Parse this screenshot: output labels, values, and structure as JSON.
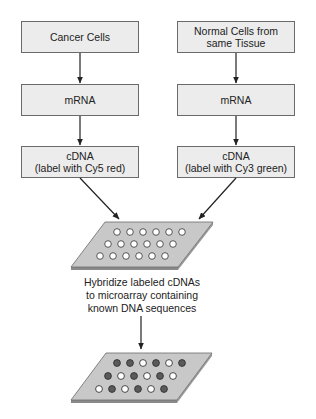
{
  "diagram": {
    "colors": {
      "box_fill": "#ececec",
      "box_border": "#6a6a6a",
      "arrow": "#222222",
      "slide_top": "#c8c8c8",
      "slide_edge": "#8a8a8a",
      "dot_light": "#ffffff",
      "dot_dark": "#5a5a5a"
    },
    "left_column": {
      "source": {
        "lines": [
          "Cancer Cells"
        ]
      },
      "mrna": {
        "lines": [
          "mRNA"
        ]
      },
      "cdna": {
        "lines": [
          "cDNA",
          "(label with Cy5 red)"
        ]
      }
    },
    "right_column": {
      "source": {
        "lines": [
          "Normal Cells from",
          "same Tissue"
        ]
      },
      "mrna": {
        "lines": [
          "mRNA"
        ]
      },
      "cdna": {
        "lines": [
          "cDNA",
          "(label with Cy3 green)"
        ]
      }
    },
    "microarray_before": {
      "label": "Unhybridized microarray",
      "rows": [
        [
          "empty",
          "empty",
          "empty",
          "empty",
          "empty",
          "empty"
        ],
        [
          "empty",
          "empty",
          "empty",
          "empty",
          "empty",
          "empty"
        ],
        [
          "empty",
          "empty",
          "empty",
          "empty",
          "empty",
          "empty"
        ]
      ]
    },
    "hybridize_caption": {
      "lines": [
        "Hybridize labeled cDNAs",
        "to microarray containing",
        "known DNA sequences"
      ]
    },
    "microarray_after": {
      "label": "Hybridized microarray",
      "rows": [
        [
          "dark",
          "dark",
          "light",
          "dark",
          "light",
          "dark"
        ],
        [
          "dark",
          "light",
          "dark",
          "light",
          "dark",
          "light"
        ],
        [
          "light",
          "dark",
          "light",
          "dark",
          "light",
          "dark"
        ]
      ]
    }
  }
}
